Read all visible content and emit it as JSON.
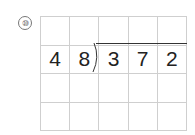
{
  "problem": {
    "number_label": "⑩",
    "divisor": [
      "4",
      "8"
    ],
    "dividend": [
      "3",
      "7",
      "2"
    ],
    "grid": {
      "columns": 5,
      "rows": 4
    }
  }
}
